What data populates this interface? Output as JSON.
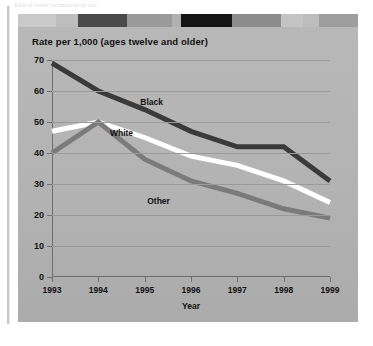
{
  "figure": {
    "caption_top": "Rates of violent victimization by race",
    "panel_bg": "#b4b4b4",
    "deco_band": [
      {
        "width": 38,
        "color": "#c9c9c9"
      },
      {
        "width": 22,
        "color": "#bdbdbd"
      },
      {
        "width": 49,
        "color": "#4a4a4a"
      },
      {
        "width": 45,
        "color": "#9a9a9a"
      },
      {
        "width": 9,
        "color": "#b0b0b0"
      },
      {
        "width": 51,
        "color": "#151515"
      },
      {
        "width": 49,
        "color": "#8c8c8c"
      },
      {
        "width": 22,
        "color": "#c4c4c4"
      },
      {
        "width": 16,
        "color": "#bdbdbd"
      },
      {
        "width": 39,
        "color": "#9e9e9e"
      }
    ]
  },
  "chart_data": {
    "type": "line",
    "title": "Rate per 1,000 (ages twelve and older)",
    "xlabel": "Year",
    "ylabel": "Rate per 1,000 (ages twelve and older)",
    "categories": [
      "1993",
      "1994",
      "1995",
      "1996",
      "1997",
      "1998",
      "1999"
    ],
    "x": [
      1993,
      1994,
      1995,
      1996,
      1997,
      1998,
      1999
    ],
    "xlim": [
      1993,
      1999
    ],
    "ylim": [
      0,
      70
    ],
    "yticks": [
      0,
      10,
      20,
      30,
      40,
      50,
      60,
      70
    ],
    "grid": true,
    "legend_position": "inline-labels",
    "series": [
      {
        "name": "Black",
        "color": "#3a3a3a",
        "values": [
          69,
          60,
          54,
          47,
          42,
          42,
          31
        ],
        "label_x": 1995.15,
        "label_y": 56.5
      },
      {
        "name": "White",
        "color": "#ffffff",
        "values": [
          47,
          50,
          45,
          39,
          36,
          31,
          24
        ],
        "label_x": 1994.5,
        "label_y": 46.5
      },
      {
        "name": "Other",
        "color": "#7b7b7b",
        "values": [
          40,
          50,
          38,
          31,
          27,
          22,
          19
        ],
        "label_x": 1995.3,
        "label_y": 24.5
      }
    ]
  }
}
